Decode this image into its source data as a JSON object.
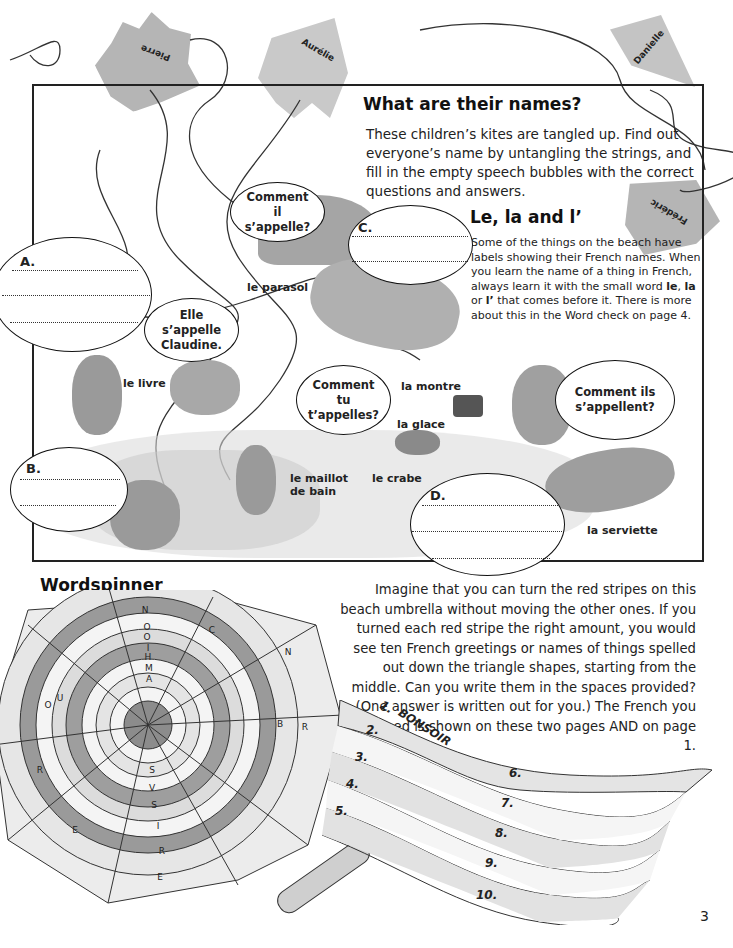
{
  "page": {
    "number": "3"
  },
  "kites": [
    {
      "name": "Pierre"
    },
    {
      "name": "Aurélie"
    },
    {
      "name": "Danielle"
    },
    {
      "name": "Frédéric"
    }
  ],
  "names_section": {
    "title": "What are their names?",
    "intro": "These children’s kites are tangled up. Find out everyone’s name by untangling the strings, and fill in the empty speech bubbles with the correct questions and answers."
  },
  "articles_section": {
    "title": "Le, la and l’",
    "text_before": "Some of the things on the beach have labels showing their French names. When you learn the name of a thing in French, always learn it with the small word ",
    "w1": "le",
    "sep1": ", ",
    "w2": "la",
    "sep2": " or ",
    "w3": "l’",
    "text_after": " that comes before it. There is more about this in the Word check on page 4."
  },
  "speech_bubbles": {
    "comment_il": "Comment il s’appelle?",
    "elle_claudine": "Elle s’appelle Claudine.",
    "comment_tu": "Comment tu t’appelles?",
    "comment_ils": "Comment ils s’appellent?"
  },
  "blank_bubbles": [
    {
      "letter": "A."
    },
    {
      "letter": "B."
    },
    {
      "letter": "C."
    },
    {
      "letter": "D."
    }
  ],
  "beach_labels": {
    "parasol": "le parasol",
    "livre": "le livre",
    "montre": "la montre",
    "glace": "la glace",
    "crabe": "le crabe",
    "maillot": "le maillot de bain",
    "serviette": "la serviette"
  },
  "wordspinner": {
    "title": "Wordspinner",
    "instructions": "Imagine that you can turn the red stripes on this beach umbrella without moving the other ones. If you turned each red stripe the right amount, you would see ten French greetings or names of things spelled out down the triangle shapes, starting from the middle. Can you write them in the spaces provided? (One answer is written out for you.) The French you will need is shown on these two pages AND on page 1.",
    "answers": [
      {
        "num": "1.",
        "value": "BONSOIR"
      },
      {
        "num": "2.",
        "value": ""
      },
      {
        "num": "3.",
        "value": ""
      },
      {
        "num": "4.",
        "value": ""
      },
      {
        "num": "5.",
        "value": ""
      },
      {
        "num": "6.",
        "value": ""
      },
      {
        "num": "7.",
        "value": ""
      },
      {
        "num": "8.",
        "value": ""
      },
      {
        "num": "9.",
        "value": ""
      },
      {
        "num": "10.",
        "value": ""
      }
    ],
    "letters": [
      "N",
      "O",
      "O",
      "I",
      "H",
      "M",
      "A",
      "A",
      "L",
      "C",
      "S",
      "T",
      "V",
      "J",
      "C",
      "O",
      "I",
      "N",
      "E",
      "C",
      "O",
      "N",
      "E",
      "E",
      "O",
      "B",
      "R",
      "L",
      "B",
      "L",
      "E",
      "A",
      "L",
      "A",
      "O",
      "N",
      "U",
      "R",
      "S",
      "V",
      "S",
      "I",
      "R",
      "E",
      "A",
      "R",
      "G",
      "A",
      "U",
      "O",
      "E",
      "R",
      "E",
      "U",
      "A",
      "E",
      "C",
      "L",
      "E",
      "S",
      "L",
      "L",
      "I",
      "L",
      "E",
      "T",
      "A",
      "E"
    ]
  },
  "colors": {
    "ink": "#1a1a1a",
    "kite_grey": "#b5b5b5",
    "stripe_dark": "#8f8f8f",
    "stripe_light": "#d9d9d9"
  }
}
